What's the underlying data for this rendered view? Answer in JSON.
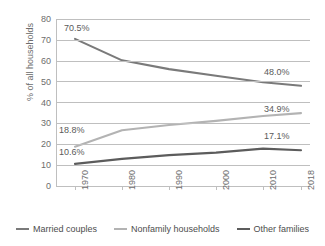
{
  "chart_data": {
    "type": "line",
    "title": "",
    "xlabel": "",
    "ylabel": "% of all households",
    "categories": [
      "1970",
      "1980",
      "1990",
      "2000",
      "2010",
      "2018"
    ],
    "ylim": [
      0,
      80
    ],
    "yticks": [
      0,
      10,
      20,
      30,
      40,
      50,
      60,
      70,
      80
    ],
    "grid": true,
    "legend_position": "bottom",
    "series": [
      {
        "name": "Married couples",
        "color": "#7a7a7a",
        "values": [
          70.5,
          60.2,
          56.0,
          52.8,
          49.7,
          48.0
        ],
        "labels": [
          {
            "text": "70.5%",
            "index": 0
          },
          {
            "text": "48.0%",
            "index": 5
          }
        ]
      },
      {
        "name": "Nonfamily households",
        "color": "#b3b3b3",
        "values": [
          18.8,
          26.7,
          29.2,
          31.2,
          33.5,
          34.9
        ],
        "labels": [
          {
            "text": "18.8%",
            "index": 0
          },
          {
            "text": "34.9%",
            "index": 5
          }
        ]
      },
      {
        "name": "Other families",
        "color": "#5c5c5c",
        "values": [
          10.6,
          13.0,
          14.8,
          16.0,
          17.9,
          17.1
        ],
        "labels": [
          {
            "text": "10.6%",
            "index": 0
          },
          {
            "text": "17.1%",
            "index": 5
          }
        ]
      }
    ]
  },
  "axis": {
    "y_title": "% of all households",
    "y_tick_labels": [
      "80",
      "70",
      "60",
      "50",
      "40",
      "30",
      "20",
      "10",
      "0"
    ],
    "x_tick_labels": [
      "1970",
      "1980",
      "1990",
      "2000",
      "2010",
      "2018"
    ]
  },
  "data_labels": {
    "married_start": "70.5%",
    "married_end": "48.0%",
    "nonfamily_start": "18.8%",
    "nonfamily_end": "34.9%",
    "other_start": "10.6%",
    "other_end": "17.1%"
  },
  "legend": {
    "items": [
      {
        "label": "Married couples",
        "color": "#7a7a7a"
      },
      {
        "label": "Nonfamily households",
        "color": "#b3b3b3"
      },
      {
        "label": "Other families",
        "color": "#5c5c5c"
      }
    ]
  }
}
